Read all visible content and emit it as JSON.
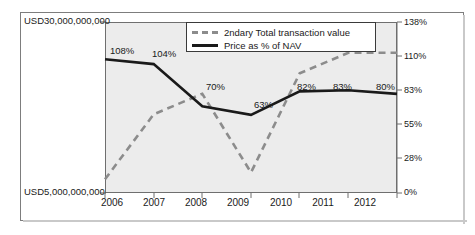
{
  "chart_data": {
    "type": "line",
    "title": "",
    "xlabel": "",
    "ylabel": "",
    "categories": [
      "2006",
      "2007",
      "2008",
      "2009",
      "2010",
      "2011",
      "2012"
    ],
    "left_axis": {
      "label_top": "USD30,000,000,000",
      "label_bottom": "USD5,000,000,000",
      "min": 5000000000,
      "max": 30000000000,
      "ticks": [
        "USD5,000,000,000",
        "USD30,000,000,000"
      ]
    },
    "right_axis": {
      "ticks": [
        "0%",
        "28%",
        "55%",
        "83%",
        "110%",
        "138%"
      ],
      "values": [
        0,
        28,
        55,
        83,
        110,
        138
      ],
      "min": 0,
      "max": 138
    },
    "grid": false,
    "legend_position": "top-center",
    "series": [
      {
        "name": "2ndary Total transaction value",
        "style": "dashed",
        "color": "#8c8c8c",
        "axis": "left",
        "values": [
          7000000000,
          16500000000,
          19500000000,
          8000000000,
          22500000000,
          25500000000,
          25500000000
        ],
        "labels": [
          "",
          "",
          "",
          "",
          "",
          "",
          ""
        ]
      },
      {
        "name": "Price as % of NAV",
        "style": "solid",
        "color": "#1a1a1a",
        "axis": "right",
        "values": [
          108,
          104,
          70,
          63,
          82,
          83,
          80
        ],
        "labels": [
          "108%",
          "104%",
          "70%",
          "63%",
          "82%",
          "83%",
          "80%"
        ]
      }
    ]
  },
  "legend": {
    "items": [
      {
        "label": "2ndary Total transaction value",
        "style": "dashed"
      },
      {
        "label": "Price as % of NAV",
        "style": "solid"
      }
    ]
  }
}
